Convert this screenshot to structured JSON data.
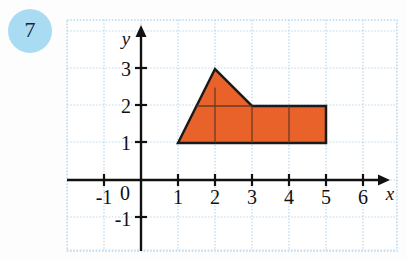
{
  "problem": {
    "number": "7",
    "badge_color": "#a9dcf2",
    "badge_text_color": "#16243a"
  },
  "chart_data": {
    "type": "scatter",
    "title": "",
    "xlabel": "x",
    "ylabel": "y",
    "xlim": [
      -1.8,
      7.0
    ],
    "ylim": [
      -1.8,
      3.7
    ],
    "grid": true,
    "grid_color": "#bcd9ef",
    "grid_spacing": 1,
    "legend": null,
    "x_tick_labels": [
      "-1",
      "0",
      "1",
      "2",
      "3",
      "4",
      "5",
      "6"
    ],
    "x_tick_values": [
      -1,
      0,
      1,
      2,
      3,
      4,
      5,
      6
    ],
    "y_tick_labels": [
      "-1",
      "1",
      "2",
      "3"
    ],
    "y_tick_values": [
      -1,
      1,
      2,
      3
    ],
    "origin_label": "0",
    "shapes": [
      {
        "name": "shaded-polygon",
        "kind": "polygon",
        "fill": "#e8622a",
        "stroke": "#1a1a1a",
        "stroke_width": 2.5,
        "vertices": [
          [
            1,
            1
          ],
          [
            2,
            3
          ],
          [
            3,
            2
          ],
          [
            5,
            2
          ],
          [
            5,
            1
          ]
        ]
      }
    ],
    "interior_gridlines": [
      {
        "kind": "vertical",
        "x": 2,
        "y_from": 1,
        "y_to": 2.5
      },
      {
        "kind": "vertical",
        "x": 3,
        "y_from": 1,
        "y_to": 2
      },
      {
        "kind": "vertical",
        "x": 4,
        "y_from": 1,
        "y_to": 2
      },
      {
        "kind": "horizontal",
        "y": 2,
        "x_from": 1.5,
        "x_to": 3
      }
    ]
  },
  "axis": {
    "x_label": "x",
    "y_label": "y",
    "arrow": true,
    "color": "#111111"
  }
}
